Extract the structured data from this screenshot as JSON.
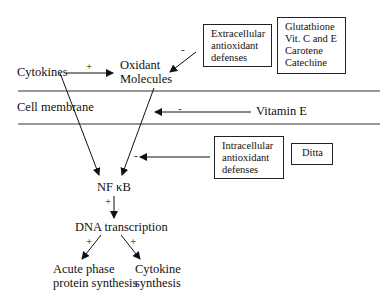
{
  "nodes": {
    "cytokines": "Cytokines",
    "oxidant_line1": "Oxidant",
    "oxidant_line2": "Molecules",
    "cell_membrane": "Cell membrane",
    "vitamin_e": "Vitamin E",
    "nfkb": "NF κB",
    "dna_transcription": "DNA transcription",
    "acute_line1": "Acute phase",
    "acute_line2": "protein synthesis",
    "cytokine_syn_line1": "Cytokine",
    "cytokine_syn_line2": "synthesis"
  },
  "boxes": {
    "extracellular": [
      "Extracellular",
      "antioxidant",
      "defenses"
    ],
    "extracellular_examples": [
      "Glutathione",
      "Vit. C and E",
      "Carotene",
      "Catechine"
    ],
    "intracellular": [
      "Intracellular",
      "antioxidant",
      "defenses"
    ],
    "intracellular_examples": [
      "Ditta"
    ]
  },
  "signs": {
    "cytokines_to_oxidant": "+",
    "extracellular_to_oxidant": "-",
    "vitamin_e": "-",
    "intracellular": "-",
    "nfkb_to_dna": "+",
    "dna_to_acute": "+",
    "dna_to_cytokine": "+"
  }
}
